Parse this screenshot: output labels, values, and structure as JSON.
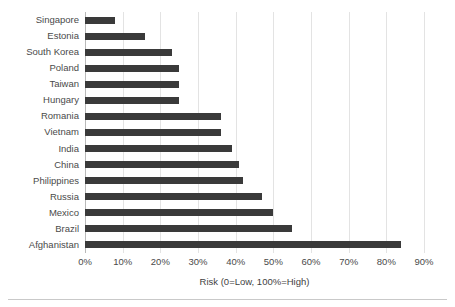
{
  "chart_data": {
    "type": "bar",
    "orientation": "horizontal",
    "title": "",
    "xlabel": "Risk (0=Low, 100%=High)",
    "ylabel": "",
    "xlim": [
      0,
      90
    ],
    "xtick_step": 10,
    "grid": true,
    "legend": false,
    "bar_color": "#3a3a3a",
    "gridline_color": "#e3e3e3",
    "axis_color": "#b9b9b9",
    "categories": [
      "Singapore",
      "Estonia",
      "South Korea",
      "Poland",
      "Taiwan",
      "Hungary",
      "Romania",
      "Vietnam",
      "India",
      "China",
      "Philippines",
      "Russia",
      "Mexico",
      "Brazil",
      "Afghanistan"
    ],
    "values": [
      8,
      16,
      23,
      25,
      25,
      25,
      36,
      36,
      39,
      41,
      42,
      47,
      50,
      55,
      84
    ],
    "xticks": [
      0,
      10,
      20,
      30,
      40,
      50,
      60,
      70,
      80,
      90
    ],
    "xtick_labels": [
      "0%",
      "10%",
      "20%",
      "30%",
      "40%",
      "50%",
      "60%",
      "70%",
      "80%",
      "90%"
    ]
  }
}
